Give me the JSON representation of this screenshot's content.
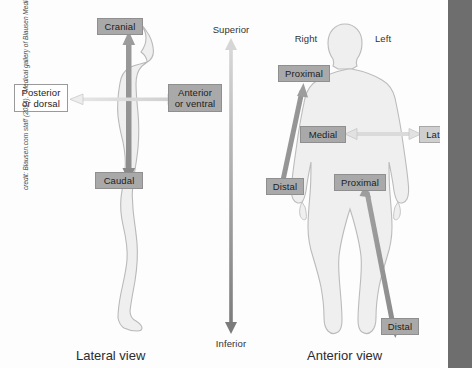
{
  "figure": {
    "background_color": "#fdfdfd",
    "rail_color": "#6e6e6e",
    "body_fill": "#efefef",
    "body_stroke": "#b9b9b9",
    "arrow_dark": "#8a8a8a",
    "arrow_light": "#dcdcdc"
  },
  "left_panel": {
    "caption": "Lateral view",
    "labels": {
      "cranial": "Cranial",
      "caudal": "Caudal",
      "posterior": "Posterior\nor dorsal",
      "posterior_line1": "Posterior",
      "posterior_line2": "or dorsal",
      "anterior_line1": "Anterior",
      "anterior_line2": "or ventral"
    }
  },
  "center_axis": {
    "top_label": "Superior",
    "bottom_label": "Inferior"
  },
  "right_panel": {
    "caption": "Anterior view",
    "labels": {
      "right": "Right",
      "left": "Left",
      "proximal_arm": "Proximal",
      "distal_arm": "Distal",
      "proximal_leg": "Proximal",
      "distal_leg": "Distal",
      "medial": "Medial",
      "lateral": "Lateral"
    }
  },
  "credit": {
    "prefix": "credit: Blausen.com staff (2014). \"Medical gallery of Blausen Medical 2014\" ",
    "italic_part": "WikiJournal of Medicine",
    "suffix": " 1 (2)",
    "full": "credit: Blausen.com staff (2014). \"Medical gallery of Blausen Medical 2014\" WikiJournal of Medicine 1 (2)"
  }
}
